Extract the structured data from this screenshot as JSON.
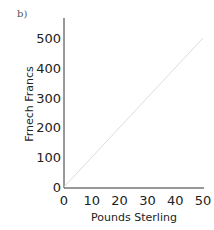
{
  "panel_label": "b)",
  "chart_data": {
    "type": "line",
    "title": "",
    "xlabel": "Pounds Sterling",
    "ylabel": "Frnech Francs",
    "x_ticks": [
      "0",
      "10",
      "20",
      "30",
      "40",
      "50"
    ],
    "y_ticks": [
      "0",
      "100",
      "200",
      "300",
      "400",
      "500"
    ],
    "xlim": [
      0,
      50
    ],
    "ylim": [
      0,
      550
    ],
    "grid": false,
    "series": [
      {
        "name": "conversion",
        "x": [
          0,
          50
        ],
        "values": [
          0,
          500
        ],
        "color": "#dddddd"
      }
    ]
  }
}
